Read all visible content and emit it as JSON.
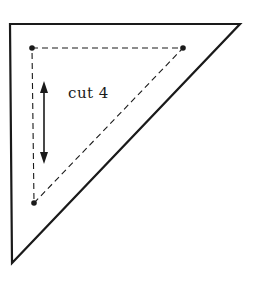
{
  "diagram": {
    "type": "quilt-pattern-template",
    "shape": "right-triangle",
    "instruction_label": "cut 4",
    "colors": {
      "stroke": "#1a1a1a",
      "background": "#ffffff"
    },
    "outer_triangle": {
      "points": [
        [
          10,
          24
        ],
        [
          240,
          24
        ],
        [
          12,
          263
        ]
      ],
      "stroke_width": 2.2
    },
    "seam_triangle": {
      "points": [
        [
          32,
          48
        ],
        [
          183,
          48
        ],
        [
          34,
          203
        ]
      ],
      "dash": "6,4",
      "stroke_width": 1.1
    },
    "corner_dots": [
      [
        32,
        48
      ],
      [
        183,
        48
      ],
      [
        34,
        203
      ]
    ],
    "grain_arrow": {
      "x": 44,
      "y1": 82,
      "y2": 163
    },
    "label_position": {
      "x": 68,
      "y": 84
    }
  }
}
